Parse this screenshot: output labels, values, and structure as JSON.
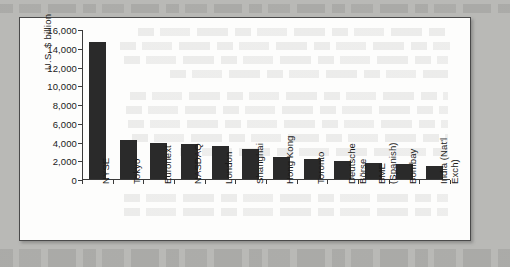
{
  "figure": {
    "panel_background": "#fdfdfc",
    "page_background": "#b9b9b6",
    "border_color": "#4a4a4a"
  },
  "chart_data": {
    "type": "bar",
    "title": "",
    "subtitle": "",
    "xlabel": "",
    "ylabel": "U.S. $ billion",
    "ylim": [
      0,
      16000
    ],
    "ytick_values": [
      0,
      2000,
      4000,
      6000,
      8000,
      10000,
      12000,
      14000,
      16000
    ],
    "ytick_labels": [
      "0",
      "2,000",
      "4,000",
      "6,000",
      "8,000",
      "10,000",
      "12,000",
      "14,000",
      "16,000"
    ],
    "grid": false,
    "legend": false,
    "legend_position": "none",
    "bar_color": "#2a2a2a",
    "categories": [
      "NYSE",
      "Tokyo",
      "Euronext",
      "NASDAQ",
      "London",
      "Shanghai",
      "Hong Kong",
      "Deutsche Börse",
      "Toronto",
      "BME (Spanish)",
      "Bombay",
      "India (Nat'l Exch)"
    ],
    "category_labels": [
      [
        "NYSE"
      ],
      [
        "Tokyo"
      ],
      [
        "Euronext"
      ],
      [
        "NASDAQ"
      ],
      [
        "London"
      ],
      [
        "Shanghai"
      ],
      [
        "Hong Kong"
      ],
      [
        "Toronto"
      ],
      [
        "Deutsche",
        "Börse"
      ],
      [
        "BME",
        "(Spanish)"
      ],
      [
        "Bombay"
      ],
      [
        "India (Nat'l",
        "Exch)"
      ]
    ],
    "values": [
      14600,
      4150,
      3800,
      3750,
      3500,
      3200,
      2300,
      2100,
      1900,
      1700,
      1550,
      1400
    ]
  }
}
